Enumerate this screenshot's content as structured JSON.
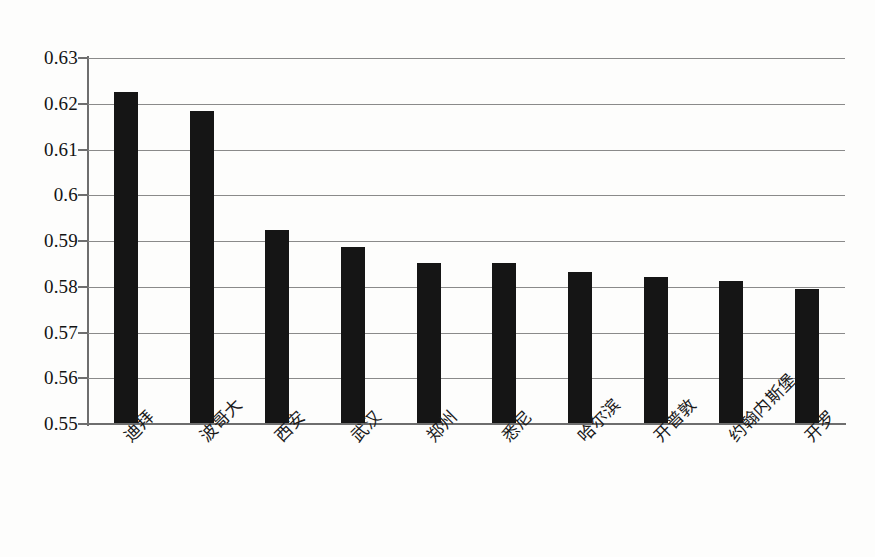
{
  "chart_data": {
    "type": "bar",
    "title": "",
    "subtitle": "",
    "xlabel": "",
    "ylabel": "",
    "categories": [
      "迪拜",
      "波哥大",
      "西安",
      "武汉",
      "郑州",
      "悉尼",
      "哈尔滨",
      "开普敦",
      "约翰内斯堡",
      "开罗"
    ],
    "values": [
      0.6225,
      0.6185,
      0.5925,
      0.5888,
      0.5852,
      0.5852,
      0.5832,
      0.5822,
      0.5812,
      0.5795
    ],
    "ylim": [
      0.55,
      0.63
    ],
    "ytick_labels": [
      "0.63",
      "0.62",
      "0.61",
      "0.6",
      "0.59",
      "0.58",
      "0.57",
      "0.56",
      "0.55"
    ],
    "ytick_values": [
      0.63,
      0.62,
      0.61,
      0.6,
      0.59,
      0.58,
      0.57,
      0.56,
      0.55
    ],
    "grid": true,
    "grid_axis": "y",
    "legend": false,
    "legend_position": "none",
    "bar_color": "#151515",
    "grid_color": "#8a8a8a",
    "axis_color": "#6e6e6e",
    "background_color": "#fdfdfc",
    "xtick_label_rotation": -45
  }
}
